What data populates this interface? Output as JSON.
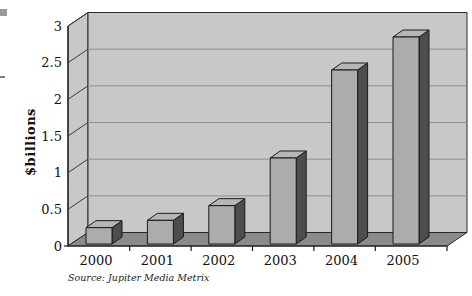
{
  "page": {
    "background": "#ffffff",
    "decorations": {
      "corner_square_color": "#999999",
      "left_dash_color": "#7d7d7d"
    }
  },
  "chart_data": {
    "type": "bar",
    "style": "3d-column",
    "title": "",
    "xlabel": "",
    "ylabel": "$billions",
    "categories": [
      "2000",
      "2001",
      "2002",
      "2003",
      "2004",
      "2005"
    ],
    "values": [
      0.25,
      0.35,
      0.55,
      1.2,
      2.4,
      2.85
    ],
    "ylim": [
      0,
      3
    ],
    "ytick_step": 0.5,
    "yticks": [
      "0",
      "0.5",
      "1",
      "1.5",
      "2",
      "2.5",
      "3"
    ],
    "grid": true,
    "legend": false,
    "source_note": "Source: Jupiter Media Metrix",
    "colors": {
      "wall": "#c8c8c8",
      "floor": "#8b8b8b",
      "bar_front": "#acacac",
      "bar_top": "#b6b6b6",
      "bar_side": "#4d4d4d",
      "gridline": "#8f8f8f",
      "outline": "#2a2a2a",
      "text": "#111111"
    }
  }
}
